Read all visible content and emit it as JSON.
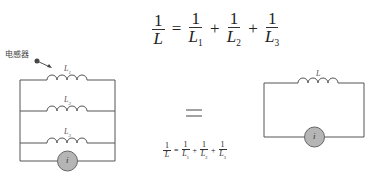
{
  "top_formula": {
    "lhs_num": "1",
    "lhs_den": "L",
    "equals": "=",
    "terms": [
      {
        "num": "1",
        "den": "L",
        "sub": "1"
      },
      {
        "num": "1",
        "den": "L",
        "sub": "2"
      },
      {
        "num": "1",
        "den": "L",
        "sub": "3"
      }
    ],
    "plus": "+"
  },
  "left_circuit": {
    "callout_label": "电感器",
    "inductors": [
      {
        "label": "L",
        "sub": "1"
      },
      {
        "label": "L",
        "sub": "2"
      },
      {
        "label": "L",
        "sub": "3"
      }
    ],
    "source_label": "i"
  },
  "equivalence_sign": "=",
  "small_formula": {
    "lhs_num": "1",
    "lhs_den": "L",
    "equals": "=",
    "terms": [
      {
        "num": "1",
        "den": "L",
        "sub": "1"
      },
      {
        "num": "1",
        "den": "L",
        "sub": "2"
      },
      {
        "num": "1",
        "den": "L",
        "sub": "3"
      }
    ],
    "plus": "+"
  },
  "right_circuit": {
    "inductor_label": "L",
    "source_label": "i"
  },
  "colors": {
    "wire": "#555555",
    "source_fill": "#b5b5b5",
    "text": "#222222"
  }
}
